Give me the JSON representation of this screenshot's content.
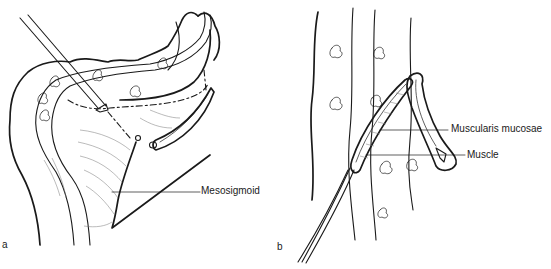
{
  "figure": {
    "panels": [
      {
        "id": "a",
        "letter": "a",
        "labels": [
          {
            "text": "Mesosigmoid"
          }
        ]
      },
      {
        "id": "b",
        "letter": "b",
        "labels": [
          {
            "text": "Muscularis mucosae"
          },
          {
            "text": "Muscle"
          }
        ]
      }
    ]
  }
}
